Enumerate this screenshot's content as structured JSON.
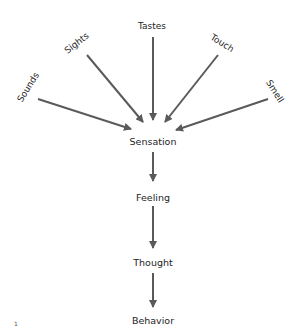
{
  "diagram": {
    "inputs": [
      {
        "id": "sounds",
        "label": "Sounds"
      },
      {
        "id": "sights",
        "label": "Sights"
      },
      {
        "id": "tastes",
        "label": "Tastes"
      },
      {
        "id": "touch",
        "label": "Touch"
      },
      {
        "id": "smell",
        "label": "Smell"
      }
    ],
    "chain": [
      {
        "id": "sensation",
        "label": "Sensation"
      },
      {
        "id": "feeling",
        "label": "Feeling"
      },
      {
        "id": "thought",
        "label": "Thought"
      },
      {
        "id": "behavior",
        "label": "Behavior"
      }
    ],
    "page_mark": "1",
    "arrow_color": "#5a5a5a"
  }
}
